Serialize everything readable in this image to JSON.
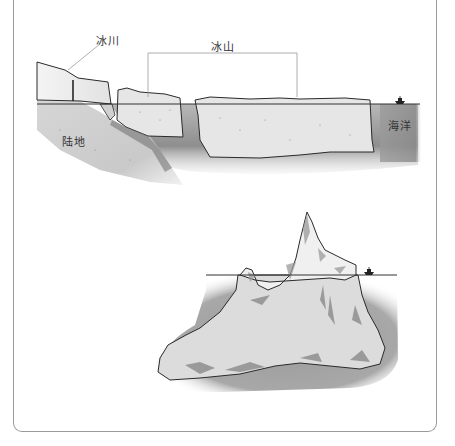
{
  "figure": {
    "top_diagram": {
      "title": "Glacier calving icebergs into the ocean (cross-section)",
      "labels": {
        "glacier": "冰川",
        "iceberg": "冰山",
        "land": "陆地",
        "ocean": "海洋"
      },
      "icons": [
        "ship-icon"
      ]
    },
    "bottom_diagram": {
      "title": "Iceberg above and below the waterline",
      "icons": [
        "ship-icon"
      ]
    },
    "colors": {
      "frame": "#9a9a9a",
      "ice_fill": "#e4e4e4",
      "water_dark": "#8f8f8f",
      "water_light": "#d8d8d8",
      "land_fill": "#cfcfcf",
      "outline": "#2a2a2a"
    }
  }
}
